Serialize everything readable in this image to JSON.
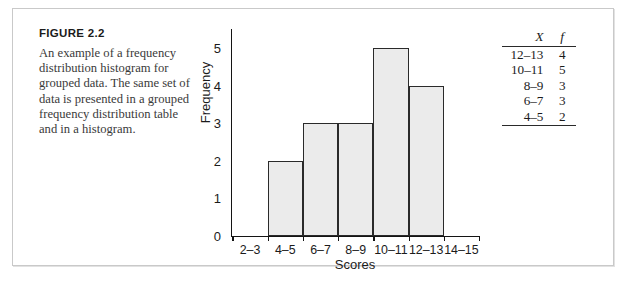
{
  "figure": {
    "number_label": "FIGURE 2.2",
    "caption": "An example of a frequency distribution histogram for grouped data. The same set of data is presented in a grouped frequency distribution table and in a histogram."
  },
  "table": {
    "headers": [
      "X",
      "f"
    ],
    "rows": [
      {
        "x": "12–13",
        "f": "4"
      },
      {
        "x": "10–11",
        "f": "5"
      },
      {
        "x": "8–9",
        "f": "3"
      },
      {
        "x": "6–7",
        "f": "3"
      },
      {
        "x": "4–5",
        "f": "2"
      }
    ]
  },
  "chart_data": {
    "type": "bar",
    "title": "",
    "xlabel": "Scores",
    "ylabel": "Frequency",
    "categories": [
      "2–3",
      "4–5",
      "6–7",
      "8–9",
      "10–11",
      "12–13",
      "14–15"
    ],
    "values": [
      0,
      2,
      3,
      3,
      5,
      4,
      0
    ],
    "ylim": [
      0,
      5
    ],
    "yticks": [
      "0",
      "1",
      "2",
      "3",
      "4",
      "5"
    ],
    "grid": false,
    "legend": "none"
  },
  "colors": {
    "bar_fill": "#ebebeb",
    "bar_stroke": "#2a2a2a",
    "axis": "#141414",
    "frame_border": "#c9c9c9",
    "text": "#1b1b1b",
    "caption_text": "#3a3a3a"
  }
}
